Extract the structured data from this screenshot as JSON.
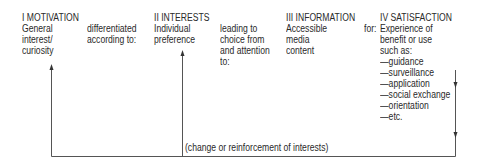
{
  "stages": [
    {
      "heading": "I MOTIVATION",
      "lines": [
        "General",
        "interest/",
        "curiosity"
      ]
    },
    {
      "heading": "II INTERESTS",
      "lines": [
        "Individual",
        "preference"
      ]
    },
    {
      "heading": "III INFORMATION",
      "lines": [
        "Accessible",
        "media",
        "content"
      ],
      "trailing": "for:"
    },
    {
      "heading": "IV SATISFACTION",
      "lines": [
        "Experience of",
        "benefit or use",
        "such as:",
        "—guidance",
        "—surveillance",
        "—application",
        "—social exchange",
        "—orientation",
        "—etc."
      ]
    }
  ],
  "connectors": [
    {
      "lines": [
        "differentiated",
        "according to:"
      ]
    },
    {
      "lines": [
        "leading to",
        "choice from",
        "and attention",
        "to:"
      ]
    }
  ],
  "feedback_label": "(change or reinforcement of interests)",
  "colors": {
    "text": "#2a2a2a",
    "line": "#555555"
  }
}
